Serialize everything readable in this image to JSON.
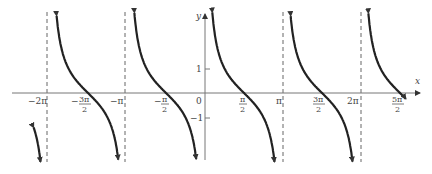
{
  "chart_data": {
    "type": "line",
    "title": "",
    "function": "y = cot x",
    "xlabel": "x",
    "ylabel": "y",
    "xlim": [
      -6.9,
      8.4
    ],
    "ylim": [
      -3.2,
      3.3
    ],
    "grid": false,
    "x_ticks": [
      {
        "value": -6.2832,
        "label": "−2π"
      },
      {
        "value": -4.7124,
        "label": "3π/2",
        "sign": "−"
      },
      {
        "value": -3.1416,
        "label": "−π"
      },
      {
        "value": -1.5708,
        "label": "π/2",
        "sign": "−"
      },
      {
        "value": 0,
        "label": "0"
      },
      {
        "value": 1.5708,
        "label": "π/2"
      },
      {
        "value": 3.1416,
        "label": "π"
      },
      {
        "value": 4.7124,
        "label": "3π/2"
      },
      {
        "value": 6.2832,
        "label": "2π"
      },
      {
        "value": 7.854,
        "label": "5π/2"
      }
    ],
    "y_ticks": [
      {
        "value": 1,
        "label": "1"
      },
      {
        "value": -1,
        "label": "−1"
      }
    ],
    "asymptotes": [
      -6.2832,
      -3.1416,
      0,
      3.1416,
      6.2832
    ],
    "zeros": [
      -4.7124,
      -1.5708,
      1.5708,
      4.7124,
      7.854
    ],
    "series": [
      {
        "name": "cot x",
        "branches": [
          [
            -6.9,
            -6.35
          ],
          [
            -6.2,
            -3.21
          ],
          [
            -3.07,
            -0.07
          ],
          [
            0.07,
            3.07
          ],
          [
            3.21,
            6.21
          ],
          [
            6.35,
            8.2
          ]
        ]
      }
    ]
  },
  "labels": {
    "x_axis": "x",
    "y_axis": "y",
    "origin": "0",
    "y_one": "1",
    "y_neg_one": "−1",
    "neg_2pi": "−2π",
    "neg_pi": "−π",
    "pi": "π",
    "two_pi": "2π",
    "neg_3pi_2_num": "3π",
    "neg_pi_2_num": "π",
    "pi_2_num": "π",
    "three_pi_2_num": "3π",
    "five_pi_2_num": "5π",
    "den": "2",
    "minus": "−"
  }
}
